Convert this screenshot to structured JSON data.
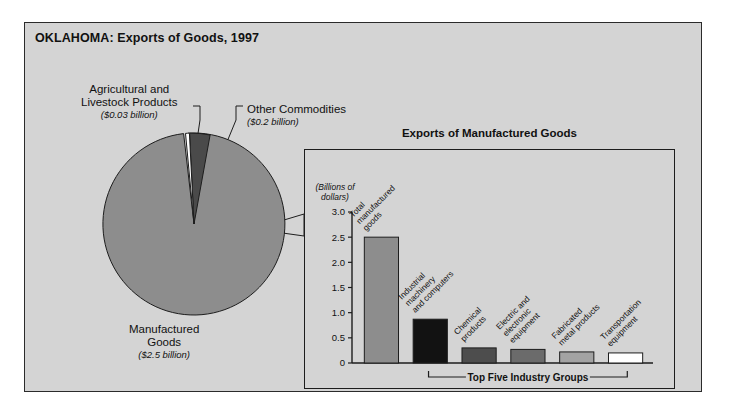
{
  "figure": {
    "title": "OKLAHOMA: Exports of Goods, 1997",
    "background_color": "#d4d4d4",
    "border_color": "#2b2b2b"
  },
  "pie": {
    "labels": {
      "agricultural": {
        "name": "Agricultural and Livestock Products",
        "line1": "Agricultural and",
        "line2": "Livestock Products",
        "value_text": "($0.03 billion)"
      },
      "other": {
        "name": "Other Commodities",
        "line1": "Other Commodities",
        "line2": "",
        "value_text": "($0.2 billion)"
      },
      "manufactured": {
        "name": "Manufactured Goods",
        "line1": "Manufactured",
        "line2": "Goods",
        "value_text": "($2.5 billion)"
      }
    }
  },
  "inset": {
    "title": "Exports of Manufactured Goods",
    "axis_unit_line1": "(Billions of",
    "axis_unit_line2": "dollars)",
    "bracket_label": "Top Five Industry Groups"
  },
  "chart_data": [
    {
      "type": "pie",
      "title": "OKLAHOMA: Exports of Goods, 1997",
      "unit": "billions of dollars",
      "labels": [
        "Manufactured Goods",
        "Other Commodities",
        "Agricultural and Livestock Products"
      ],
      "values": [
        2.5,
        0.2,
        0.03
      ],
      "value_labels": [
        "($2.5 billion)",
        "($0.2 billion)",
        "($0.03 billion)"
      ],
      "colors": [
        "#8d8d8d",
        "#4a4a4a",
        "#ffffff"
      ],
      "legend": "labels placed around pie with leader lines"
    },
    {
      "type": "bar",
      "title": "Exports of Manufactured Goods",
      "xlabel": "",
      "ylabel": "(Billions of dollars)",
      "ylim": [
        0,
        3.0
      ],
      "yticks": [
        "0",
        "0.5",
        "1.0",
        "1.5",
        "2.0",
        "2.5",
        "3.0"
      ],
      "ytick_values": [
        0,
        0.5,
        1.0,
        1.5,
        2.0,
        2.5,
        3.0
      ],
      "grid": false,
      "categories": [
        "Total manufactured goods",
        "Industrial machinery and computers",
        "Chemical products",
        "Electric and electronic equipment",
        "Fabricated metal products",
        "Transportation equipment"
      ],
      "category_lines": [
        [
          "Total",
          "manufactured",
          "goods"
        ],
        [
          "Industrial",
          "machinery",
          "and computers"
        ],
        [
          "Chemical",
          "products"
        ],
        [
          "Electric and",
          "electronic",
          "equipment"
        ],
        [
          "Fabricated",
          "metal products"
        ],
        [
          "Transportation",
          "equipment"
        ]
      ],
      "values": [
        2.5,
        0.87,
        0.3,
        0.27,
        0.22,
        0.2
      ],
      "colors": [
        "#8d8d8d",
        "#121212",
        "#4d4d4d",
        "#6b6b6b",
        "#a3a3a3",
        "#ffffff"
      ],
      "annotation": "Top Five Industry Groups"
    }
  ]
}
